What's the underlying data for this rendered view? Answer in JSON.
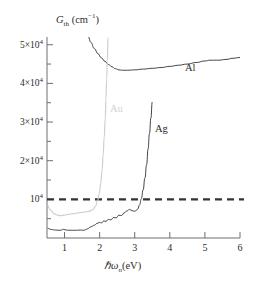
{
  "chart_data": {
    "type": "line",
    "title": "",
    "xlabel": "hbar omega_n (eV)",
    "ylabel": "G_th (cm^-1)",
    "xlim": [
      0.5,
      6.0
    ],
    "ylim": [
      0,
      52000
    ],
    "grid": false,
    "legend_position": "inline-annotations",
    "xticks": [
      1,
      2,
      3,
      4,
      5,
      6
    ],
    "xtick_labels": [
      "1",
      "2",
      "3",
      "4",
      "5",
      "6"
    ],
    "yticks": [
      10000,
      20000,
      30000,
      40000,
      50000
    ],
    "ytick_labels": [
      "10⁴",
      "2×10⁴",
      "3×10⁴",
      "4×10⁴",
      "5×10⁴"
    ],
    "yminor_ticks": [
      5000,
      15000,
      25000,
      35000,
      45000
    ],
    "threshold_line": {
      "value": 10000,
      "style": "dashed",
      "color": "#333333",
      "label": ""
    },
    "series": [
      {
        "name": "Al",
        "color": "#3a3a3a",
        "annotation": "Al",
        "annotation_x": 4.15,
        "annotation_y": 41200,
        "points": [
          [
            1.68,
            52000
          ],
          [
            1.75,
            50600
          ],
          [
            1.85,
            49000
          ],
          [
            1.95,
            47700
          ],
          [
            2.05,
            46600
          ],
          [
            2.15,
            45700
          ],
          [
            2.25,
            44900
          ],
          [
            2.35,
            44300
          ],
          [
            2.45,
            43800
          ],
          [
            2.55,
            43500
          ],
          [
            2.65,
            43400
          ],
          [
            2.8,
            43400
          ],
          [
            3.0,
            43500
          ],
          [
            3.25,
            43700
          ],
          [
            3.5,
            43900
          ],
          [
            3.75,
            44100
          ],
          [
            4.0,
            44400
          ],
          [
            4.25,
            44700
          ],
          [
            4.5,
            45000
          ],
          [
            4.75,
            45400
          ],
          [
            5.0,
            45800
          ],
          [
            5.15,
            46000
          ],
          [
            5.4,
            46000
          ],
          [
            5.6,
            46200
          ],
          [
            5.8,
            46500
          ],
          [
            6.0,
            46700
          ]
        ]
      },
      {
        "name": "Au",
        "color": "#cfcfcf",
        "annotation": "Au",
        "annotation_x": 2.2,
        "annotation_y": 32600,
        "points": [
          [
            0.52,
            8400
          ],
          [
            0.6,
            7200
          ],
          [
            0.7,
            6300
          ],
          [
            0.8,
            5900
          ],
          [
            0.9,
            5800
          ],
          [
            1.0,
            5900
          ],
          [
            1.1,
            6100
          ],
          [
            1.25,
            6300
          ],
          [
            1.4,
            6500
          ],
          [
            1.55,
            6700
          ],
          [
            1.7,
            6900
          ],
          [
            1.8,
            7300
          ],
          [
            1.88,
            8200
          ],
          [
            1.94,
            9600
          ],
          [
            1.99,
            11500
          ],
          [
            2.03,
            14000
          ],
          [
            2.07,
            17500
          ],
          [
            2.1,
            21500
          ],
          [
            2.13,
            26000
          ],
          [
            2.16,
            31000
          ],
          [
            2.18,
            36000
          ],
          [
            2.2,
            41000
          ],
          [
            2.22,
            46000
          ],
          [
            2.24,
            52000
          ]
        ]
      },
      {
        "name": "Ag",
        "color": "#3a3a3a",
        "annotation": "Ag",
        "annotation_x": 3.58,
        "annotation_y": 27600,
        "points": [
          [
            0.52,
            2500
          ],
          [
            0.62,
            2200
          ],
          [
            0.75,
            2050
          ],
          [
            0.88,
            2000
          ],
          [
            0.97,
            2250
          ],
          [
            1.05,
            2050
          ],
          [
            1.15,
            2000
          ],
          [
            1.3,
            2000
          ],
          [
            1.45,
            2050
          ],
          [
            1.55,
            2000
          ],
          [
            1.65,
            2350
          ],
          [
            1.75,
            2900
          ],
          [
            1.85,
            3300
          ],
          [
            1.92,
            3750
          ],
          [
            2.0,
            4050
          ],
          [
            2.05,
            3900
          ],
          [
            2.12,
            4400
          ],
          [
            2.18,
            4300
          ],
          [
            2.25,
            4800
          ],
          [
            2.32,
            4700
          ],
          [
            2.4,
            5300
          ],
          [
            2.47,
            5200
          ],
          [
            2.55,
            5900
          ],
          [
            2.62,
            5800
          ],
          [
            2.7,
            6500
          ],
          [
            2.78,
            7000
          ],
          [
            2.85,
            7400
          ],
          [
            2.92,
            7100
          ],
          [
            3.0,
            6900
          ],
          [
            3.08,
            7400
          ],
          [
            3.14,
            8600
          ],
          [
            3.19,
            10200
          ],
          [
            3.24,
            12500
          ],
          [
            3.29,
            15500
          ],
          [
            3.34,
            19000
          ],
          [
            3.38,
            23000
          ],
          [
            3.42,
            27000
          ],
          [
            3.46,
            31000
          ],
          [
            3.5,
            35200
          ]
        ]
      }
    ]
  },
  "axes": {
    "ylabel_main": "G",
    "ylabel_sub": "th",
    "ylabel_unit": "(cm",
    "ylabel_unit_sup": "−1",
    "ylabel_unit_close": ")",
    "xlabel_hbar": "ℏω",
    "xlabel_sub": "n",
    "xlabel_unit": "(eV)"
  }
}
